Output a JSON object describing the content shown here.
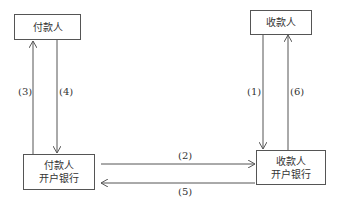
{
  "nodes": {
    "payer": {
      "label": "付款人"
    },
    "payee": {
      "label": "收款人"
    },
    "payer_bank": {
      "line1": "付款人",
      "line2": "开户银行"
    },
    "payee_bank": {
      "line1": "收款人",
      "line2": "开户银行"
    }
  },
  "edges": [
    {
      "id": "1",
      "label": "(1)",
      "from": "payee",
      "to": "payee_bank"
    },
    {
      "id": "2",
      "label": "(2)",
      "from": "payer_bank",
      "to": "payee_bank"
    },
    {
      "id": "3",
      "label": "(3)",
      "from": "payer_bank",
      "to": "payer"
    },
    {
      "id": "4",
      "label": "(4)",
      "from": "payer",
      "to": "payer_bank"
    },
    {
      "id": "5",
      "label": "(5)",
      "from": "payee_bank",
      "to": "payer_bank"
    },
    {
      "id": "6",
      "label": "(6)",
      "from": "payee_bank",
      "to": "payee"
    }
  ],
  "colors": {
    "line": "#555555",
    "text": "#333333"
  }
}
